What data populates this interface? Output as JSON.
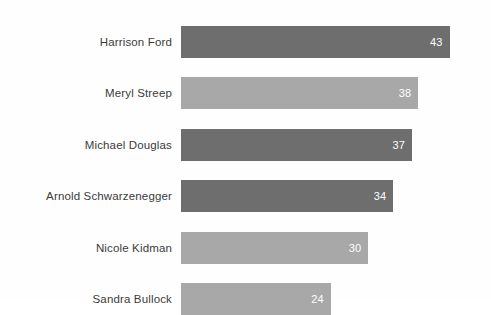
{
  "chart_data": {
    "type": "bar",
    "orientation": "horizontal",
    "title": "",
    "subtitle": "",
    "xlabel": "",
    "ylabel": "",
    "grid": false,
    "legend": "none",
    "axis_visible": false,
    "xlim": [
      0,
      49
    ],
    "categories": [
      "Harrison Ford",
      "Meryl Streep",
      "Michael Douglas",
      "Arnold Schwarzenegger",
      "Nicole Kidman",
      "Sandra Bullock"
    ],
    "values": [
      43,
      38,
      37,
      34,
      30,
      24
    ],
    "value_labels": [
      "43",
      "38",
      "37",
      "34",
      "30",
      "24"
    ],
    "bar_colors": [
      "#6e6e6e",
      "#a8a8a8",
      "#6e6e6e",
      "#6e6e6e",
      "#a8a8a8",
      "#a8a8a8"
    ],
    "bars": [
      {
        "label": "Harrison Ford",
        "value": 43,
        "value_label": "43",
        "color": "#6e6e6e"
      },
      {
        "label": "Meryl Streep",
        "value": 38,
        "value_label": "38",
        "color": "#a8a8a8"
      },
      {
        "label": "Michael Douglas",
        "value": 37,
        "value_label": "37",
        "color": "#6e6e6e"
      },
      {
        "label": "Arnold Schwarzenegger",
        "value": 34,
        "value_label": "34",
        "color": "#6e6e6e"
      },
      {
        "label": "Nicole Kidman",
        "value": 30,
        "value_label": "30",
        "color": "#a8a8a8"
      },
      {
        "label": "Sandra Bullock",
        "value": 24,
        "value_label": "24",
        "color": "#a8a8a8"
      }
    ]
  },
  "style": {
    "background": "#fefefe",
    "label_color": "#3b3b3b",
    "value_label_color": "#ffffff",
    "dark_bar": "#6e6e6e",
    "light_bar": "#a8a8a8"
  }
}
